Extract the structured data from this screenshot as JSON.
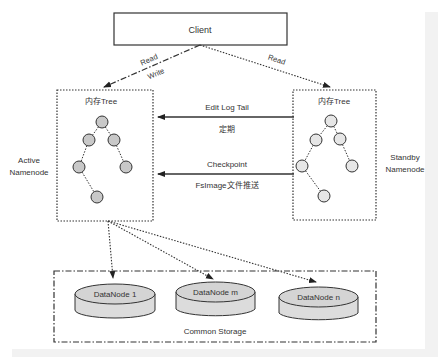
{
  "client": {
    "label": "Client"
  },
  "arrows": {
    "client_to_active_top": "Read",
    "client_to_active_bottom": "Write",
    "client_to_standby": "Read",
    "edit_log_tail": {
      "label": "Edit Log Tail",
      "sublabel": "定期"
    },
    "checkpoint": {
      "label": "Checkpoint",
      "sublabel": "FsImage文件推送"
    }
  },
  "active_namenode": {
    "title": "内存Tree",
    "side_label_line1": "Active",
    "side_label_line2": "Namenode",
    "node_color": "#c8c8c8"
  },
  "standby_namenode": {
    "title": "内存Tree",
    "side_label_line1": "Standby",
    "side_label_line2": "Namenode",
    "node_color": "#e6e6e6"
  },
  "storage": {
    "label": "Common Storage",
    "datanodes": [
      {
        "label": "DataNode 1"
      },
      {
        "label": "DataNode m"
      },
      {
        "label": "DataNode n"
      }
    ]
  }
}
